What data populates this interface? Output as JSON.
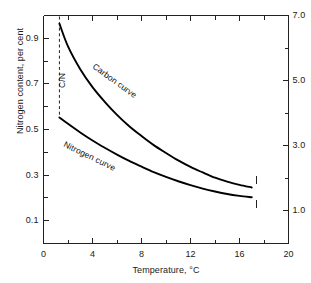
{
  "chart_data": {
    "type": "line",
    "title": "",
    "xlabel": "Temperature, °C",
    "ylabel": "Nitrogen content, per cent",
    "y2label": "Carbon content, per cent",
    "xlim": [
      0,
      20
    ],
    "ylim": [
      0.0,
      1.0
    ],
    "y2lim": [
      0.0,
      7.0
    ],
    "grid": false,
    "legend": "inline-curve-labels",
    "xticks": [
      0,
      4,
      8,
      12,
      16,
      20
    ],
    "xticklabels": [
      "0",
      "4",
      "8",
      "12",
      "16",
      "20"
    ],
    "xminorticks": [
      2,
      6,
      10,
      14,
      18
    ],
    "yticks": [
      0.1,
      0.3,
      0.5,
      0.7,
      0.9
    ],
    "yticklabels": [
      "0.1",
      "0.3",
      "0.5",
      "0.7",
      "0.9"
    ],
    "yminorticks": [
      0.2,
      0.4,
      0.6,
      0.8,
      1.0
    ],
    "y2ticks": [
      1.0,
      3.0,
      5.0,
      7.0
    ],
    "y2ticklabels": [
      "1.0",
      "3.0",
      "5.0",
      "7.0"
    ],
    "y2minorticks": [
      2.0,
      4.0,
      6.0
    ],
    "annotations": [
      {
        "name": "cn-ratio-line",
        "text": "C/N",
        "x": 1.3,
        "rotated": true,
        "style": "dashed-vertical"
      }
    ],
    "series": [
      {
        "name": "Carbon curve",
        "axis": "right",
        "label": "Carbon curve",
        "x": [
          1.3,
          2.0,
          3.0,
          4.0,
          5.0,
          6.0,
          7.0,
          8.0,
          9.0,
          10.0,
          11.0,
          12.0,
          13.0,
          14.0,
          15.0,
          16.0,
          17.0
        ],
        "values": [
          6.75,
          6.05,
          5.35,
          4.8,
          4.35,
          3.95,
          3.6,
          3.3,
          3.02,
          2.78,
          2.55,
          2.35,
          2.18,
          2.02,
          1.9,
          1.8,
          1.72
        ]
      },
      {
        "name": "Nitrogen curve",
        "axis": "left",
        "label": "Nitrogen curve",
        "x": [
          1.3,
          2.0,
          3.0,
          4.0,
          5.0,
          6.0,
          7.0,
          8.0,
          9.0,
          10.0,
          11.0,
          12.0,
          13.0,
          14.0,
          15.0,
          16.0,
          17.0
        ],
        "values": [
          0.553,
          0.525,
          0.487,
          0.452,
          0.42,
          0.39,
          0.362,
          0.337,
          0.313,
          0.292,
          0.273,
          0.256,
          0.241,
          0.228,
          0.217,
          0.209,
          0.203
        ]
      }
    ],
    "endpoint_markers": [
      {
        "name": "carbon-endpoint-tick",
        "x": 17.4,
        "y2": 1.95
      },
      {
        "name": "nitrogen-endpoint-tick",
        "x": 17.4,
        "y": 0.175
      }
    ],
    "colors": {
      "curve": "#000000",
      "axis": "#222222",
      "text": "#1a1a1a",
      "background": "#ffffff"
    }
  },
  "axes": {
    "x_label": "Temperature, °C",
    "y_left_label": "Nitrogen content, per cent",
    "y_right_label": "Carbon content, per cent"
  },
  "labels": {
    "carbon_curve": "Carbon curve",
    "nitrogen_curve": "Nitrogen curve",
    "cn_ratio": "C/N"
  },
  "x_ticks": {
    "t0": "0",
    "t1": "4",
    "t2": "8",
    "t3": "12",
    "t4": "16",
    "t5": "20"
  },
  "y_left_ticks": {
    "t0": "0.1",
    "t1": "0.3",
    "t2": "0.5",
    "t3": "0.7",
    "t4": "0.9"
  },
  "y_right_ticks": {
    "t0": "1.0",
    "t1": "3.0",
    "t2": "5.0",
    "t3": "7.0"
  }
}
